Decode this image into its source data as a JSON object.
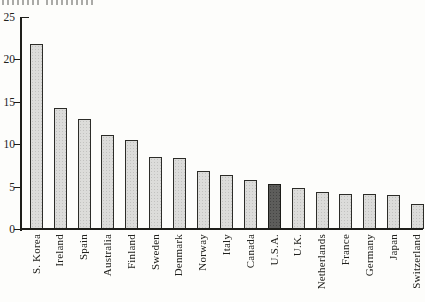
{
  "figure": {
    "background": "#fdfdfb",
    "top_edge_fragment": "partially cut-off text at top edge (illegible)"
  },
  "chart_data": {
    "type": "bar",
    "title": "",
    "xlabel": "",
    "ylabel": "",
    "categories": [
      "S. Korea",
      "Ireland",
      "Spain",
      "Australia",
      "Finland",
      "Sweden",
      "Denmark",
      "Norway",
      "Italy",
      "Canada",
      "U.S.A.",
      "U.K.",
      "Netherlands",
      "France",
      "Germany",
      "Japan",
      "Switzerland"
    ],
    "values": [
      21.8,
      14.3,
      13.0,
      11.1,
      10.5,
      8.5,
      8.4,
      6.8,
      6.4,
      5.8,
      5.3,
      4.8,
      4.4,
      4.1,
      4.1,
      4.0,
      2.9
    ],
    "highlight_category": "U.S.A.",
    "ylim": [
      0,
      25
    ],
    "yticks": [
      0,
      5,
      10,
      15,
      20,
      25
    ],
    "ytick_labels": [
      "0",
      "5",
      "10",
      "15",
      "20",
      "25"
    ],
    "grid": "off",
    "legend": "none",
    "colors": {
      "bar_fill": "#dcdcda",
      "highlight_fill": "#5d5d5b",
      "bar_outline": "#2c2c28",
      "axis": "#1e1e1a",
      "text": "#21211d"
    }
  }
}
